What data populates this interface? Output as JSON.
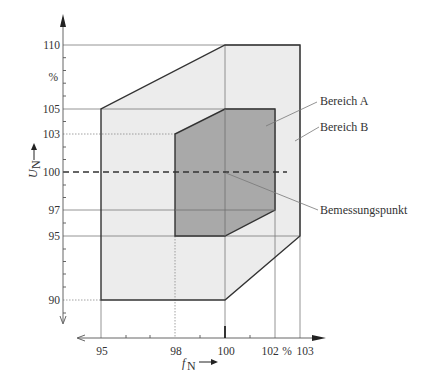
{
  "diagram": {
    "type": "operating-range-diagram",
    "x_axis": {
      "symbol": "f",
      "subscript": "N",
      "arrow": "→",
      "unit": "%",
      "ticks": [
        "95",
        "98",
        "100",
        "102",
        "103"
      ],
      "unit_label": "%"
    },
    "y_axis": {
      "symbol": "U",
      "subscript": "N",
      "arrow": "→",
      "unit_label": "%",
      "ticks": [
        "110",
        "105",
        "103",
        "100",
        "97",
        "95",
        "90"
      ]
    },
    "regions": [
      {
        "name": "Bereich A",
        "fill": "#a9a9a9",
        "vertices_pct": [
          [
            98,
            95
          ],
          [
            98,
            103
          ],
          [
            100,
            105
          ],
          [
            102,
            105
          ],
          [
            102,
            97
          ],
          [
            100,
            95
          ]
        ]
      },
      {
        "name": "Bereich B",
        "fill": "#ececec",
        "vertices_pct": [
          [
            95,
            90
          ],
          [
            95,
            105
          ],
          [
            100,
            110
          ],
          [
            103,
            110
          ],
          [
            103,
            95
          ],
          [
            100,
            90
          ]
        ]
      }
    ],
    "rated_point": {
      "label": "Bemessungspunkt",
      "f_pct": 100,
      "u_pct": 100
    },
    "labels": {
      "region_a": "Bereich A",
      "region_b": "Bereich B",
      "rated_point": "Bemessungspunkt"
    },
    "colors": {
      "region_a": "#a9a9a9",
      "region_b": "#ececec",
      "outline": "#333333",
      "gridline": "#888888"
    }
  }
}
